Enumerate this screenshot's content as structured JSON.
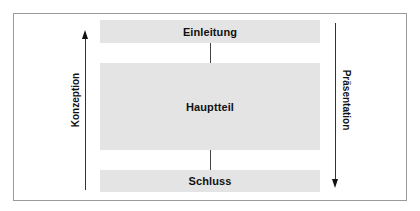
{
  "diagram": {
    "blocks": [
      {
        "label": "Einleitung"
      },
      {
        "label": "Hauptteil"
      },
      {
        "label": "Schluss"
      }
    ],
    "left_axis": {
      "label": "Konzeption",
      "direction": "up"
    },
    "right_axis": {
      "label": "Präsentation",
      "direction": "down"
    },
    "colors": {
      "block_fill": "#e4e4e4",
      "frame_border": "#9a9a9a",
      "line": "#333333",
      "text": "#111111"
    }
  }
}
